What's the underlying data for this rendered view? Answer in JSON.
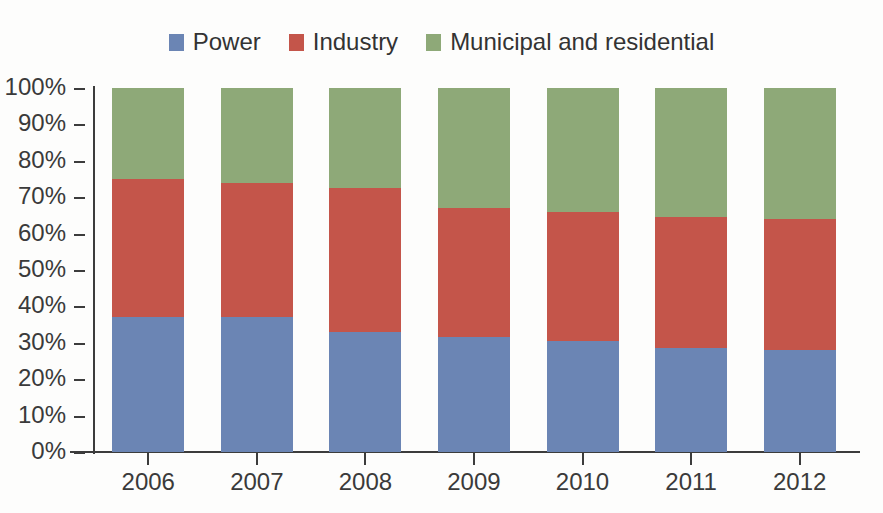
{
  "chart_data": {
    "type": "bar",
    "subtype": "stacked-percentage",
    "title": "",
    "xlabel": "",
    "ylabel": "",
    "categories": [
      "2006",
      "2007",
      "2008",
      "2009",
      "2010",
      "2011",
      "2012"
    ],
    "series": [
      {
        "name": "Power",
        "color": "#6b85b4",
        "values": [
          37,
          37,
          33,
          31.5,
          30.5,
          28.5,
          28
        ]
      },
      {
        "name": "Industry",
        "color": "#c4554a",
        "values": [
          38,
          37,
          39.5,
          35.5,
          35.5,
          36,
          36
        ]
      },
      {
        "name": "Municipal and residential",
        "color": "#8ea978",
        "values": [
          25,
          26,
          27.5,
          33,
          34,
          35.5,
          36
        ]
      }
    ],
    "cumulative_tops": {
      "Power": [
        37,
        37,
        33,
        31.5,
        30.5,
        28.5,
        28
      ],
      "Power+Industry": [
        75,
        74,
        72.5,
        67,
        66,
        64.5,
        64
      ],
      "total": [
        100,
        100,
        100,
        100,
        100,
        100,
        100
      ]
    },
    "ylim": [
      0,
      100
    ],
    "ytick_values": [
      100,
      90,
      80,
      70,
      60,
      50,
      40,
      30,
      20,
      10,
      0
    ],
    "ytick_labels": [
      "100%",
      "90%",
      "80%",
      "70%",
      "60%",
      "50%",
      "40%",
      "30%",
      "20%",
      "10%",
      "0%"
    ],
    "grid": false,
    "legend_position": "top-center",
    "legend": [
      {
        "label": "Power",
        "color": "#6b85b4"
      },
      {
        "label": "Industry",
        "color": "#c4554a"
      },
      {
        "label": "Municipal and residential",
        "color": "#8ea978"
      }
    ]
  },
  "colors": {
    "power": "#6b85b4",
    "industry": "#c4554a",
    "municipal": "#8ea978",
    "axis": "#3c3c3c",
    "text": "#3a3a3a",
    "background": "#fdfdfc"
  }
}
